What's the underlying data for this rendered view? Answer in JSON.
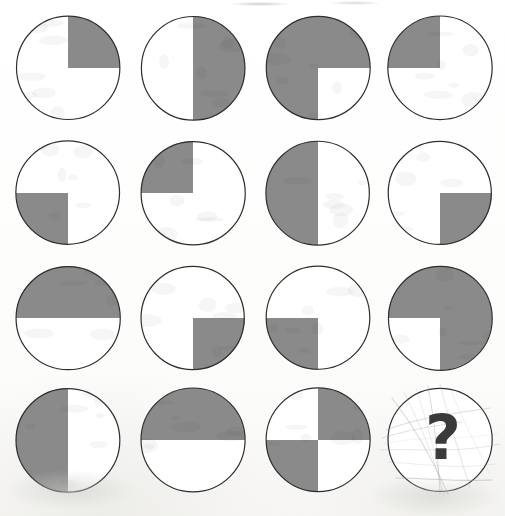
{
  "page": {
    "medium": "scanned pencil-and-print worksheet",
    "background_color": "#fdfdfc",
    "rows": 4,
    "columns": 4
  },
  "style": {
    "shade_color": "#8a8a8a",
    "unshaded_color": "#ffffff",
    "outline_color": "#2e2e2e",
    "outline_width": 1.2,
    "question_mark_color": "#3a3a3a",
    "scribble_color": "#9a9a98"
  },
  "legend": {
    "quadrant_names": [
      "top-left",
      "top-right",
      "bottom-left",
      "bottom-right"
    ],
    "shaded_label": "shaded",
    "unshaded_label": "unshaded",
    "question_label": "?"
  },
  "chart_data": {
    "type": "table",
    "rows": 4,
    "columns": 4,
    "quadrant_order": [
      "tl",
      "tr",
      "bl",
      "br"
    ],
    "cells": [
      {
        "id": "r1c1",
        "row": 1,
        "col": 1,
        "kind": "circle",
        "shaded": {
          "tl": false,
          "tr": true,
          "bl": false,
          "br": false
        },
        "shaded_count": 1,
        "fraction": "1/4",
        "description": "top-right quadrant shaded"
      },
      {
        "id": "r1c2",
        "row": 1,
        "col": 2,
        "kind": "circle",
        "shaded": {
          "tl": false,
          "tr": true,
          "bl": false,
          "br": true
        },
        "shaded_count": 2,
        "fraction": "2/4",
        "description": "right half shaded"
      },
      {
        "id": "r1c3",
        "row": 1,
        "col": 3,
        "kind": "circle",
        "shaded": {
          "tl": true,
          "tr": true,
          "bl": true,
          "br": false
        },
        "shaded_count": 3,
        "fraction": "3/4",
        "description": "all shaded except bottom-right quadrant"
      },
      {
        "id": "r1c4",
        "row": 1,
        "col": 4,
        "kind": "circle",
        "shaded": {
          "tl": true,
          "tr": false,
          "bl": false,
          "br": false
        },
        "shaded_count": 1,
        "fraction": "1/4",
        "description": "top-left quadrant shaded"
      },
      {
        "id": "r2c1",
        "row": 2,
        "col": 1,
        "kind": "circle",
        "shaded": {
          "tl": false,
          "tr": false,
          "bl": true,
          "br": false
        },
        "shaded_count": 1,
        "fraction": "1/4",
        "description": "bottom-left quadrant shaded"
      },
      {
        "id": "r2c2",
        "row": 2,
        "col": 2,
        "kind": "circle",
        "shaded": {
          "tl": true,
          "tr": false,
          "bl": false,
          "br": false
        },
        "shaded_count": 1,
        "fraction": "1/4",
        "description": "top-left quadrant shaded"
      },
      {
        "id": "r2c3",
        "row": 2,
        "col": 3,
        "kind": "circle",
        "shaded": {
          "tl": true,
          "tr": false,
          "bl": true,
          "br": false
        },
        "shaded_count": 2,
        "fraction": "2/4",
        "description": "left half shaded"
      },
      {
        "id": "r2c4",
        "row": 2,
        "col": 4,
        "kind": "circle",
        "shaded": {
          "tl": false,
          "tr": false,
          "bl": false,
          "br": true
        },
        "shaded_count": 1,
        "fraction": "1/4",
        "description": "bottom-right quadrant shaded"
      },
      {
        "id": "r3c1",
        "row": 3,
        "col": 1,
        "kind": "circle",
        "shaded": {
          "tl": true,
          "tr": true,
          "bl": false,
          "br": false
        },
        "shaded_count": 2,
        "fraction": "2/4",
        "description": "top half shaded"
      },
      {
        "id": "r3c2",
        "row": 3,
        "col": 2,
        "kind": "circle",
        "shaded": {
          "tl": false,
          "tr": false,
          "bl": false,
          "br": true
        },
        "shaded_count": 1,
        "fraction": "1/4",
        "description": "bottom-right quadrant shaded"
      },
      {
        "id": "r3c3",
        "row": 3,
        "col": 3,
        "kind": "circle",
        "shaded": {
          "tl": false,
          "tr": false,
          "bl": true,
          "br": false
        },
        "shaded_count": 1,
        "fraction": "1/4",
        "description": "bottom-left quadrant shaded"
      },
      {
        "id": "r3c4",
        "row": 3,
        "col": 4,
        "kind": "circle",
        "shaded": {
          "tl": true,
          "tr": true,
          "bl": false,
          "br": true
        },
        "shaded_count": 3,
        "fraction": "3/4",
        "description": "all shaded except bottom-left quadrant"
      },
      {
        "id": "r4c1",
        "row": 4,
        "col": 1,
        "kind": "circle",
        "shaded": {
          "tl": true,
          "tr": false,
          "bl": true,
          "br": false
        },
        "shaded_count": 2,
        "fraction": "2/4",
        "description": "left half shaded"
      },
      {
        "id": "r4c2",
        "row": 4,
        "col": 2,
        "kind": "circle",
        "shaded": {
          "tl": true,
          "tr": true,
          "bl": false,
          "br": false
        },
        "shaded_count": 2,
        "fraction": "2/4",
        "description": "top half shaded"
      },
      {
        "id": "r4c3",
        "row": 4,
        "col": 3,
        "kind": "circle",
        "shaded": {
          "tl": false,
          "tr": true,
          "bl": true,
          "br": false
        },
        "shaded_count": 2,
        "fraction": "2/4",
        "description": "top-right and bottom-left quadrants shaded, diagonal pattern"
      },
      {
        "id": "r4c4",
        "row": 4,
        "col": 4,
        "kind": "question",
        "shaded": {
          "tl": false,
          "tr": false,
          "bl": false,
          "br": false
        },
        "shaded_count": 0,
        "fraction": "0/4",
        "label": "?",
        "description": "missing answer cell marked with a bold question mark over pencil scribbles"
      }
    ]
  },
  "layout": {
    "cell_size": 112,
    "circle_diameter": 104,
    "column_centers": [
      68,
      193,
      318,
      440
    ],
    "row_centers": [
      68,
      193,
      318,
      440
    ]
  }
}
